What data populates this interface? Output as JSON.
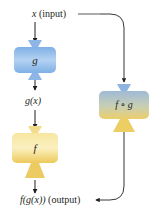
{
  "diagram": {
    "input_label": {
      "var": "x",
      "note": "(input)"
    },
    "intermediate_label": "g(x)",
    "output_label": {
      "expr": "f(g(x))",
      "note": "(output)"
    },
    "machines": [
      {
        "id": "g",
        "label": "g",
        "color_top": "#8ab6e8",
        "color_bottom": "#c4dbf5",
        "kind": "blue"
      },
      {
        "id": "f",
        "label": "f",
        "color_top": "#f8eaa8",
        "color_bottom": "#e8c860",
        "kind": "yellow"
      },
      {
        "id": "fog",
        "label": "f ∘ g",
        "color_top": "#9cb8d8",
        "color_bottom": "#e8cf78",
        "kind": "blend"
      }
    ],
    "colors": {
      "arrow": "#231f20",
      "blue": "#8fb8e8",
      "yellow": "#f0d678"
    }
  }
}
